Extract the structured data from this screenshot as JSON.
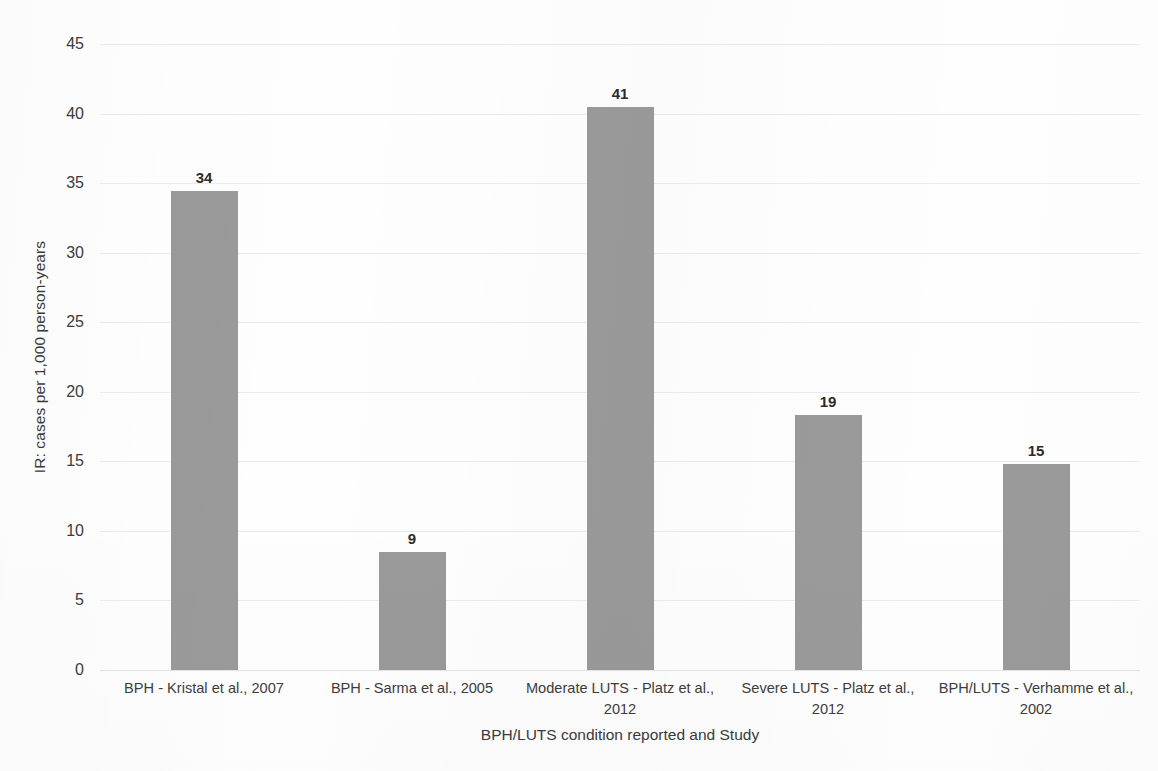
{
  "chart_data": {
    "type": "bar",
    "title": "",
    "subtitle": "",
    "xlabel": "BPH/LUTS condition reported and Study",
    "ylabel": "IR: cases per 1,000 person-years",
    "categories": [
      "BPH - Kristal et al., 2007",
      "BPH - Sarma et al., 2005",
      "Moderate LUTS - Platz et al., 2012",
      "Severe LUTS - Platz et al., 2012",
      "BPH/LUTS - Verhamme et al., 2002"
    ],
    "values": [
      34.4,
      8.5,
      40.5,
      18.3,
      14.8
    ],
    "data_labels": [
      "34",
      "9",
      "41",
      "19",
      "15"
    ],
    "ylim": [
      0,
      45
    ],
    "ytick_values": [
      0,
      5,
      10,
      15,
      20,
      25,
      30,
      35,
      40,
      45
    ],
    "ytick_labels": [
      "0",
      "5",
      "10",
      "15",
      "20",
      "25",
      "30",
      "35",
      "40",
      "45"
    ],
    "grid": true,
    "legend": false,
    "legend_position": "none",
    "bar_color": "#9a9a9a",
    "gridline_color": "#ececec",
    "background_color": "#fefefe",
    "text_color": "#3c3c3c"
  }
}
